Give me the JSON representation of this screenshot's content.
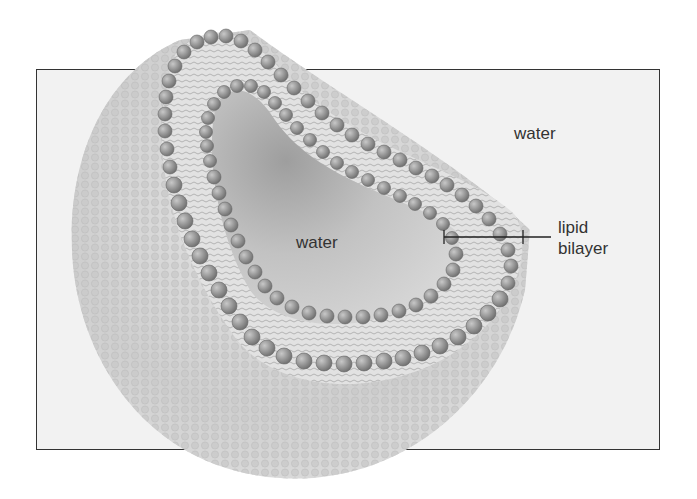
{
  "diagram": {
    "labels": {
      "outer_water": "water",
      "inner_water": "water",
      "bilayer_line1": "lipid",
      "bilayer_line2": "bilayer"
    },
    "colors": {
      "frame_border": "#333333",
      "frame_fill": "#f2f2f2",
      "head_group": "#8a8a8a",
      "tail": "#9a9a9a",
      "outer_surface": "#d0d0d0",
      "inner_cavity": "#c4c4c4",
      "text": "#333333"
    }
  }
}
